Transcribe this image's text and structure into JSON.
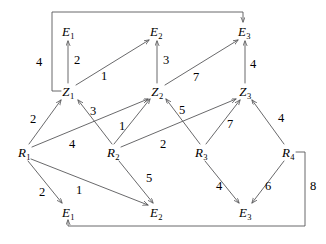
{
  "diagram": {
    "type": "weighted-directed-graph",
    "title": "",
    "nodes": [
      {
        "id": "E1_top",
        "base": "E",
        "sub": "1",
        "text": "E1",
        "x": 68,
        "y": 31
      },
      {
        "id": "E2_top",
        "base": "E",
        "sub": "2",
        "text": "E2",
        "x": 156,
        "y": 31
      },
      {
        "id": "E3_top",
        "base": "E",
        "sub": "3",
        "text": "E3",
        "x": 244,
        "y": 31
      },
      {
        "id": "Z1",
        "base": "Z",
        "sub": "1",
        "text": "Z1",
        "x": 68,
        "y": 91
      },
      {
        "id": "Z2",
        "base": "Z",
        "sub": "2",
        "text": "Z2",
        "x": 157,
        "y": 91
      },
      {
        "id": "Z3",
        "base": "Z",
        "sub": "3",
        "text": "Z3",
        "x": 245,
        "y": 91
      },
      {
        "id": "R1",
        "base": "R",
        "sub": "1",
        "text": "R1",
        "x": 24,
        "y": 152
      },
      {
        "id": "R2",
        "base": "R",
        "sub": "2",
        "text": "R2",
        "x": 113,
        "y": 152
      },
      {
        "id": "R3",
        "base": "R",
        "sub": "3",
        "text": "R3",
        "x": 201,
        "y": 152
      },
      {
        "id": "R4",
        "base": "R",
        "sub": "4",
        "text": "R4",
        "x": 288,
        "y": 152
      },
      {
        "id": "E1_bottom",
        "base": "E",
        "sub": "1",
        "text": "E1",
        "x": 68,
        "y": 212
      },
      {
        "id": "E2_bottom",
        "base": "E",
        "sub": "2",
        "text": "E2",
        "x": 156,
        "y": 212
      },
      {
        "id": "E3_bottom",
        "base": "E",
        "sub": "3",
        "text": "E3",
        "x": 245,
        "y": 212
      }
    ],
    "edges": [
      {
        "id": "z1-e1",
        "from": "Z1",
        "to": "E1_top",
        "weight": "2",
        "label_x": 77,
        "label_y": 60
      },
      {
        "id": "z1-e3",
        "from": "Z1",
        "to": "E3_top",
        "weight": "4",
        "label_x": 39,
        "label_y": 62
      },
      {
        "id": "z1-e2",
        "from": "Z1",
        "to": "E2_top",
        "weight": "1",
        "label_x": 104,
        "label_y": 76
      },
      {
        "id": "z2-e2",
        "from": "Z2",
        "to": "E2_top",
        "weight": "3",
        "label_x": 166,
        "label_y": 60
      },
      {
        "id": "z2-e3",
        "from": "Z2",
        "to": "E3_top",
        "weight": "7",
        "label_x": 196,
        "label_y": 77
      },
      {
        "id": "z3-e3",
        "from": "Z3",
        "to": "E3_top",
        "weight": "4",
        "label_x": 253,
        "label_y": 64
      },
      {
        "id": "r1-z1",
        "from": "R1",
        "to": "Z1",
        "weight": "2",
        "label_x": 33,
        "label_y": 119
      },
      {
        "id": "r2-z1",
        "from": "R2",
        "to": "Z1",
        "weight": "3",
        "label_x": 93,
        "label_y": 111
      },
      {
        "id": "r1-z2",
        "from": "R1",
        "to": "Z2",
        "weight": "4",
        "label_x": 72,
        "label_y": 144
      },
      {
        "id": "r2-z2",
        "from": "R2",
        "to": "Z2",
        "weight": "1",
        "label_x": 122,
        "label_y": 126
      },
      {
        "id": "r3-z2",
        "from": "R3",
        "to": "Z2",
        "weight": "5",
        "label_x": 182,
        "label_y": 110
      },
      {
        "id": "r2-z3",
        "from": "R2",
        "to": "Z3",
        "weight": "2",
        "label_x": 163,
        "label_y": 144
      },
      {
        "id": "r3-z3",
        "from": "R3",
        "to": "Z3",
        "weight": "7",
        "label_x": 230,
        "label_y": 124
      },
      {
        "id": "r4-z3",
        "from": "R4",
        "to": "Z3",
        "weight": "4",
        "label_x": 281,
        "label_y": 118
      },
      {
        "id": "r1-e1",
        "from": "R1",
        "to": "E1_bottom",
        "weight": "2",
        "label_x": 42,
        "label_y": 192
      },
      {
        "id": "r1-e2",
        "from": "R1",
        "to": "E2_bottom",
        "weight": "1",
        "label_x": 79,
        "label_y": 190
      },
      {
        "id": "r2-e2",
        "from": "R2",
        "to": "E2_bottom",
        "weight": "5",
        "label_x": 149,
        "label_y": 178
      },
      {
        "id": "r3-e3",
        "from": "R3",
        "to": "E3_bottom",
        "weight": "4",
        "label_x": 219,
        "label_y": 186
      },
      {
        "id": "r4-e3",
        "from": "R4",
        "to": "E3_bottom",
        "weight": "6",
        "label_x": 268,
        "label_y": 186
      },
      {
        "id": "r4-e1",
        "from": "R4",
        "to": "E1_bottom",
        "weight": "8",
        "label_x": 313,
        "label_y": 186
      }
    ],
    "colors": {
      "stroke": "#58585a",
      "text": "#000000",
      "background": "#ffffff"
    }
  }
}
